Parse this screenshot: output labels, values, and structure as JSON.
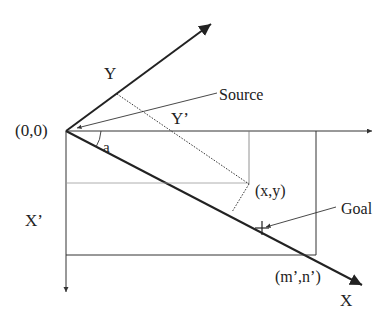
{
  "caption_fragment": "…y-axis of the coordinate space and the X axis … space",
  "labels": {
    "origin": "(0,0)",
    "y_axis": "Y",
    "y_prime": "Y’",
    "x_axis": "X",
    "x_prime": "X’",
    "source": "Source",
    "point": "(x,y)",
    "goal": "Goal",
    "corner": "(m’,n’)",
    "angle": "a"
  },
  "colors": {
    "stroke": "#222222",
    "thin": "#666666",
    "background": "#ffffff"
  }
}
